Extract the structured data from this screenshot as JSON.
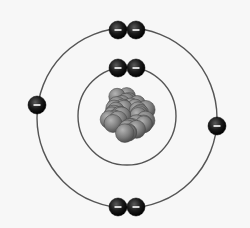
{
  "diagram": {
    "type": "bohr-atom-model",
    "center": {
      "x": 127,
      "y": 118
    },
    "colors": {
      "background": "#f7f7f7",
      "orbit": "#555555",
      "electron": "#111111",
      "electron_sign": "#ffffff",
      "nucleus": "#7a7a7a"
    },
    "nucleus": {
      "radius": 30,
      "label": "nucleus"
    },
    "shells": [
      {
        "name": "inner-shell",
        "radius": 49,
        "electron_count": 2,
        "electron_sign": "−"
      },
      {
        "name": "outer-shell",
        "radius": 90,
        "electron_count": 6,
        "electron_sign": "−"
      }
    ],
    "electrons": [
      {
        "shell": 0,
        "x": 118,
        "y": 68
      },
      {
        "shell": 0,
        "x": 136,
        "y": 68
      },
      {
        "shell": 1,
        "x": 118,
        "y": 30
      },
      {
        "shell": 1,
        "x": 136,
        "y": 30
      },
      {
        "shell": 1,
        "x": 37,
        "y": 105
      },
      {
        "shell": 1,
        "x": 217,
        "y": 126
      },
      {
        "shell": 1,
        "x": 118,
        "y": 207
      },
      {
        "shell": 1,
        "x": 136,
        "y": 207
      }
    ],
    "total_electrons": 8
  }
}
